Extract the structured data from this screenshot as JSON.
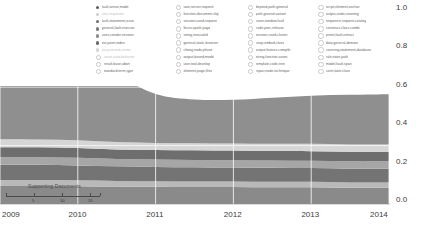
{
  "chart_data": {
    "type": "area",
    "title": "",
    "xlabel": "",
    "ylabel": "",
    "xlim": [
      2009,
      2014
    ],
    "ylim": [
      0.0,
      1.0
    ],
    "grid": true,
    "legend_position": "top",
    "x_ticks": [
      "2009",
      "2010",
      "2011",
      "2012",
      "2013",
      "2014"
    ],
    "y_ticks": [
      "0.0",
      "0.2",
      "0.4",
      "0.6",
      "0.8",
      "1.0"
    ],
    "inset": {
      "label": "Supporting Documents",
      "ticks": [
        "5",
        "10",
        "15"
      ]
    },
    "x": [
      2009,
      2009.5,
      2010,
      2010.5,
      2011,
      2011.5,
      2012,
      2012.5,
      2013,
      2013.5,
      2014
    ],
    "series": [
      {
        "name": "layer-1-bottom",
        "color": "#8a8a8a",
        "values": [
          0.062,
          0.062,
          0.061,
          0.06,
          0.059,
          0.058,
          0.058,
          0.057,
          0.057,
          0.056,
          0.056
        ]
      },
      {
        "name": "layer-2",
        "color": "#b9b9b9",
        "values": [
          0.02,
          0.02,
          0.02,
          0.019,
          0.019,
          0.019,
          0.019,
          0.019,
          0.019,
          0.018,
          0.018
        ]
      },
      {
        "name": "layer-3",
        "color": "#747474",
        "values": [
          0.052,
          0.052,
          0.051,
          0.05,
          0.049,
          0.049,
          0.048,
          0.048,
          0.047,
          0.047,
          0.047
        ]
      },
      {
        "name": "layer-4",
        "color": "#a6a6a6",
        "values": [
          0.026,
          0.026,
          0.026,
          0.025,
          0.025,
          0.025,
          0.025,
          0.025,
          0.025,
          0.025,
          0.025
        ]
      },
      {
        "name": "layer-5",
        "color": "#6e6e6e",
        "values": [
          0.034,
          0.034,
          0.034,
          0.033,
          0.033,
          0.033,
          0.033,
          0.033,
          0.033,
          0.033,
          0.033
        ]
      },
      {
        "name": "layer-6-light-band",
        "color": "#d6d6d6",
        "values": [
          0.028,
          0.027,
          0.026,
          0.025,
          0.024,
          0.024,
          0.024,
          0.024,
          0.025,
          0.025,
          0.025
        ]
      },
      {
        "name": "layer-7-main",
        "color": "#8f8f8f",
        "values": [
          0.395,
          0.36,
          0.3,
          0.23,
          0.168,
          0.15,
          0.15,
          0.158,
          0.165,
          0.17,
          0.172
        ]
      }
    ]
  },
  "legend": {
    "columns": [
      {
        "items": [
          {
            "label": "fault,sense,mode",
            "marker": "filled",
            "faint": false
          },
          {
            "label": "user,requester",
            "marker": "filled",
            "faint": true
          },
          {
            "label": "fault,statement,issue",
            "marker": "filled",
            "faint": false
          },
          {
            "label": "general,fault,execute",
            "marker": "filled",
            "faint": false
          },
          {
            "label": "uses,condor,session",
            "marker": "filled",
            "faint": false
          },
          {
            "label": "out,point,index",
            "marker": "filled",
            "faint": false
          },
          {
            "label": "out,proceed,center",
            "marker": "filled",
            "faint": true
          },
          {
            "label": "count,auto,behavior",
            "marker": "hollow",
            "faint": true
          },
          {
            "label": "result,base,abort",
            "marker": "hollow",
            "faint": false
          },
          {
            "label": "standard,term,type",
            "marker": "hollow",
            "faint": false
          }
        ]
      },
      {
        "items": [
          {
            "label": "user,server,request",
            "marker": "hollow",
            "faint": false
          },
          {
            "label": "function,document,slip",
            "marker": "hollow",
            "faint": false
          },
          {
            "label": "session,used,request",
            "marker": "hollow",
            "faint": false
          },
          {
            "label": "focus,spath,page",
            "marker": "hollow",
            "faint": false
          },
          {
            "label": "string,new,valid",
            "marker": "hollow",
            "faint": false
          },
          {
            "label": "general,static,browser",
            "marker": "hollow",
            "faint": false
          },
          {
            "label": "chang,node,phase",
            "marker": "hollow",
            "faint": false
          },
          {
            "label": "output,based,model",
            "marker": "hollow",
            "faint": false
          },
          {
            "label": "user,tool,develop",
            "marker": "hollow",
            "faint": false
          },
          {
            "label": "element,page,files",
            "marker": "hollow",
            "faint": false
          }
        ]
      },
      {
        "items": [
          {
            "label": "depend,path,general",
            "marker": "hollow",
            "faint": false
          },
          {
            "label": "path,ground,variant",
            "marker": "hollow",
            "faint": false
          },
          {
            "label": "cover,window,fault",
            "marker": "hollow",
            "faint": false
          },
          {
            "label": "code,proc,release",
            "marker": "hollow",
            "faint": false
          },
          {
            "label": "session,used,cluster",
            "marker": "hollow",
            "faint": false
          },
          {
            "label": "coop,embed,class",
            "marker": "hollow",
            "faint": false
          },
          {
            "label": "output,feature,compile",
            "marker": "hollow",
            "faint": false
          },
          {
            "label": "string,function,assoc",
            "marker": "hollow",
            "faint": false
          },
          {
            "label": "template,code,tree",
            "marker": "hollow",
            "faint": false
          },
          {
            "label": "repair,node,technique",
            "marker": "hollow",
            "faint": false
          }
        ]
      },
      {
        "items": [
          {
            "label": "script,element,anchor",
            "marker": "hollow",
            "faint": false
          },
          {
            "label": "output,undo,covering",
            "marker": "hollow",
            "faint": false
          },
          {
            "label": "sequence,request,catalog",
            "marker": "hollow",
            "faint": false
          },
          {
            "label": "construct,class,combi",
            "marker": "hollow",
            "faint": false
          },
          {
            "label": "priorit,fault,extract",
            "marker": "hollow",
            "faint": false
          },
          {
            "label": "data,general,domain",
            "marker": "hollow",
            "faint": false
          },
          {
            "label": "covering,statement,database",
            "marker": "hollow",
            "faint": false
          },
          {
            "label": "rule,state,path",
            "marker": "hollow",
            "faint": false
          },
          {
            "label": "model,fault,span",
            "marker": "hollow",
            "faint": false
          },
          {
            "label": "contr,later,class",
            "marker": "hollow",
            "faint": false
          }
        ]
      }
    ]
  }
}
